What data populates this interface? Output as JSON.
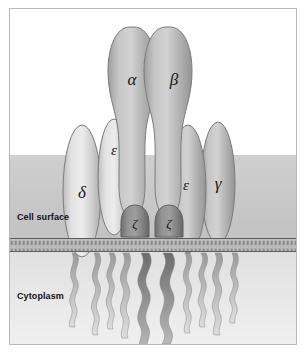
{
  "figure": {
    "zones": [
      {
        "id": "cell-surface",
        "label": "Cell surface"
      },
      {
        "id": "cytoplasm",
        "label": "Cytoplasm"
      }
    ],
    "colors": {
      "background": "#ffffff",
      "frame_border": "#b9b9b9",
      "extracellular_band": "#c9c9c9",
      "cytoplasm_band": "#dcdcdc",
      "membrane": "#b0b0b0",
      "membrane_line": "#6e6e6e",
      "subunit_light": "#d7d7d7",
      "subunit_mid": "#b4b4b4",
      "subunit_dark": "#8f8f8f",
      "zeta_fill": "#8a8a8a",
      "outline": "#6f6f6f",
      "label_text": "#111111"
    },
    "subunits": [
      {
        "id": "alpha",
        "label": "α",
        "name": "alpha-chain",
        "shade": "mid"
      },
      {
        "id": "beta",
        "label": "β",
        "name": "beta-chain",
        "shade": "mid"
      },
      {
        "id": "delta",
        "label": "δ",
        "name": "delta-chain",
        "shade": "light"
      },
      {
        "id": "epsilon-left",
        "label": "ε",
        "name": "epsilon-chain-left",
        "shade": "light"
      },
      {
        "id": "epsilon-right",
        "label": "ε",
        "name": "epsilon-chain-right",
        "shade": "mid"
      },
      {
        "id": "gamma",
        "label": "γ",
        "name": "gamma-chain",
        "shade": "mid"
      },
      {
        "id": "zeta-left",
        "label": "ζ",
        "name": "zeta-chain-left",
        "shade": "dark"
      },
      {
        "id": "zeta-right",
        "label": "ζ",
        "name": "zeta-chain-right",
        "shade": "dark"
      }
    ],
    "membrane": {
      "top": 229,
      "bottom": 243,
      "description": "lipid bilayer"
    },
    "cytoplasmic_tails": {
      "count": 10
    }
  }
}
